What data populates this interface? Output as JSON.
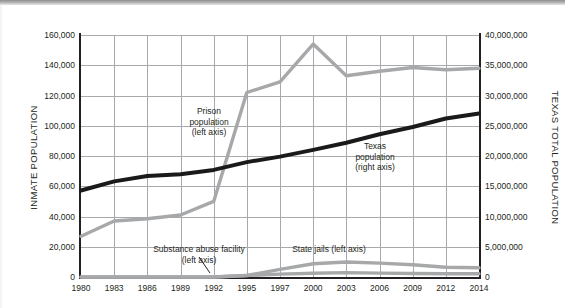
{
  "chart_data": {
    "type": "line",
    "title": "",
    "xlabel": "",
    "ylabel": "INMATE POPULATION",
    "y2label": "TEXAS TOTAL POPULATION",
    "grid": true,
    "legend_position": "inline-annotations",
    "x": [
      1980,
      1983,
      1986,
      1989,
      1992,
      1995,
      1997,
      2000,
      2003,
      2006,
      2009,
      2012,
      2014
    ],
    "xtick_labels": [
      "1980",
      "1983",
      "1986",
      "1989",
      "1992",
      "1995",
      "1997",
      "2000",
      "2003",
      "2006",
      "2009",
      "2012",
      "2014"
    ],
    "ylim": [
      0,
      160000
    ],
    "ytick_labels": [
      "0",
      "20,000",
      "40,000",
      "60,000",
      "80,000",
      "100,000",
      "120,000",
      "140,000",
      "160,000"
    ],
    "ytick_values": [
      0,
      20000,
      40000,
      60000,
      80000,
      100000,
      120000,
      140000,
      160000
    ],
    "y2lim": [
      0,
      40000000
    ],
    "y2tick_labels": [
      "0",
      "5,000,000",
      "10,000,000",
      "15,000,000",
      "20,000,000",
      "25,000,000",
      "30,000,000",
      "35,000,000",
      "40,000,000"
    ],
    "y2tick_values": [
      0,
      5000000,
      10000000,
      15000000,
      20000000,
      25000000,
      30000000,
      35000000,
      40000000
    ],
    "series": [
      {
        "name": "Prison population",
        "axis": "left",
        "color": "#a6a8aa",
        "values": [
          27000,
          37000,
          38500,
          41000,
          50000,
          122000,
          129000,
          154000,
          133000,
          136000,
          138500,
          137000,
          138000
        ]
      },
      {
        "name": "Texas population",
        "axis": "right",
        "color": "#1a1a1a",
        "values": [
          14300000,
          15800000,
          16700000,
          17000000,
          17700000,
          19000000,
          19900000,
          21000000,
          22200000,
          23600000,
          24800000,
          26200000,
          27000000
        ]
      },
      {
        "name": "State jails",
        "axis": "left",
        "color": "#a6a8aa",
        "values": [
          0,
          0,
          0,
          0,
          0,
          1000,
          5000,
          8800,
          9900,
          9200,
          8100,
          6400,
          6100
        ]
      },
      {
        "name": "Substance abuse facility",
        "axis": "left",
        "color": "#a6a8aa",
        "values": [
          0,
          0,
          0,
          0,
          0,
          1000,
          1900,
          2500,
          2900,
          2600,
          2300,
          2100,
          2200
        ]
      }
    ],
    "annotations": [
      {
        "id": "prison",
        "text_lines": [
          "Prison",
          "population",
          "(left axis)"
        ]
      },
      {
        "id": "texas",
        "text_lines": [
          "Texas",
          "population",
          "(right axis)"
        ]
      },
      {
        "id": "substance",
        "text_lines": [
          "Substance abuse facility",
          "(left axis)"
        ]
      },
      {
        "id": "statejails",
        "text_lines": [
          "State jails (left axis)"
        ]
      }
    ]
  },
  "axes": {
    "left_title": "INMATE POPULATION",
    "right_title": "TEXAS TOTAL POPULATION"
  },
  "annotations": {
    "prison_line1": "Prison",
    "prison_line2": "population",
    "prison_line3": "(left axis)",
    "texas_line1": "Texas",
    "texas_line2": "population",
    "texas_line3": "(right axis)",
    "substance_line1": "Substance abuse facility",
    "substance_line2": "(left axis)",
    "statejails_line1": "State jails (left axis)"
  }
}
